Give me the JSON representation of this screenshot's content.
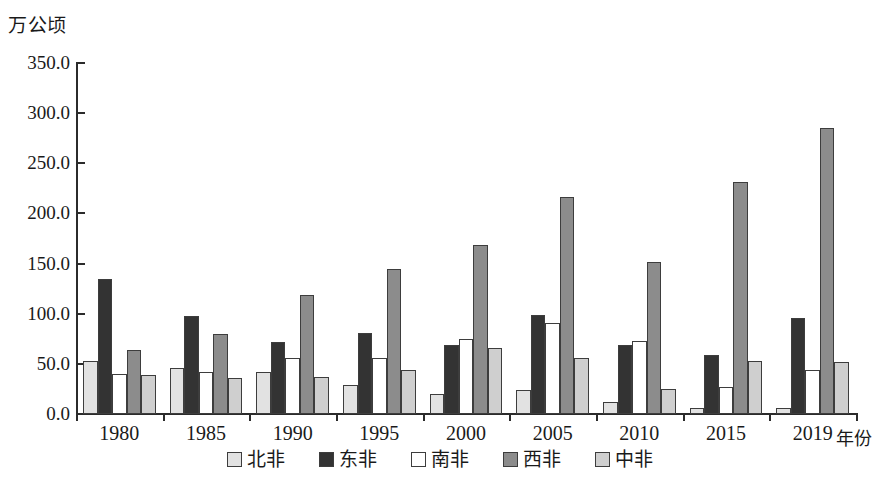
{
  "chart_data": {
    "type": "bar",
    "title": "",
    "subtitle": "",
    "ylabel": "万公顷",
    "xlabel": "年份",
    "categories": [
      "1980",
      "1985",
      "1990",
      "1995",
      "2000",
      "2005",
      "2010",
      "2015",
      "2019"
    ],
    "ylim": [
      0,
      350
    ],
    "ytick_labels": [
      "0.0",
      "50.0",
      "100.0",
      "150.0",
      "200.0",
      "250.0",
      "300.0",
      "350.0"
    ],
    "ytick_values": [
      0,
      50,
      100,
      150,
      200,
      250,
      300,
      350
    ],
    "grid": false,
    "legend_position": "bottom",
    "series": [
      {
        "name": "北非",
        "color": "#e2e2e2",
        "values": [
          53.0,
          46.0,
          42.0,
          29.0,
          20.0,
          24.0,
          12.0,
          6.0,
          6.0
        ]
      },
      {
        "name": "东非",
        "color": "#333333",
        "values": [
          135.0,
          98.0,
          72.0,
          81.0,
          69.0,
          99.0,
          69.0,
          59.0,
          96.0
        ]
      },
      {
        "name": "南非",
        "color": "#ffffff",
        "values": [
          40.0,
          42.0,
          56.0,
          56.0,
          75.0,
          91.0,
          73.0,
          27.0,
          44.0
        ]
      },
      {
        "name": "西非",
        "color": "#8c8c8c",
        "values": [
          64.0,
          80.0,
          119.0,
          145.0,
          169.0,
          216.0,
          152.0,
          231.0,
          285.0
        ]
      },
      {
        "name": "中非",
        "color": "#cfcfcf",
        "values": [
          39.0,
          36.0,
          37.0,
          44.0,
          66.0,
          56.0,
          25.0,
          53.0,
          52.0
        ]
      }
    ]
  }
}
